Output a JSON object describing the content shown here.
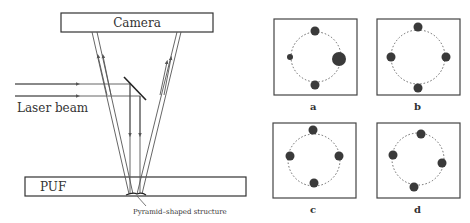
{
  "setup": {
    "camera_label": "Camera",
    "laser_label": "Laser beam",
    "puf_label": "PUF",
    "structure_label": "Pyramid–shaped structure"
  },
  "patterns": [
    {
      "label": "a",
      "spots": [
        {
          "angle": 90,
          "size": "medium"
        },
        {
          "angle": 0,
          "size": "large"
        },
        {
          "angle": 270,
          "size": "medium"
        },
        {
          "angle": 180,
          "size": "small"
        }
      ]
    },
    {
      "label": "b",
      "spots": [
        {
          "angle": 90,
          "size": "medium"
        },
        {
          "angle": 0,
          "size": "medium"
        },
        {
          "angle": 270,
          "size": "medium"
        },
        {
          "angle": 180,
          "size": "medium"
        }
      ]
    },
    {
      "label": "c",
      "spots": [
        {
          "angle": 90,
          "size": "medium"
        },
        {
          "angle": 0,
          "size": "medium"
        },
        {
          "angle": 270,
          "size": "medium"
        },
        {
          "angle": 180,
          "size": "medium"
        }
      ]
    },
    {
      "label": "d",
      "spots": [
        {
          "angle": 100,
          "size": "medium"
        },
        {
          "angle": -15,
          "size": "medium"
        },
        {
          "angle": 255,
          "size": "medium"
        },
        {
          "angle": 170,
          "size": "medium"
        }
      ]
    }
  ],
  "colors": {
    "line": "#555555",
    "spot": "#3a3a3a",
    "frame": "#444444"
  }
}
